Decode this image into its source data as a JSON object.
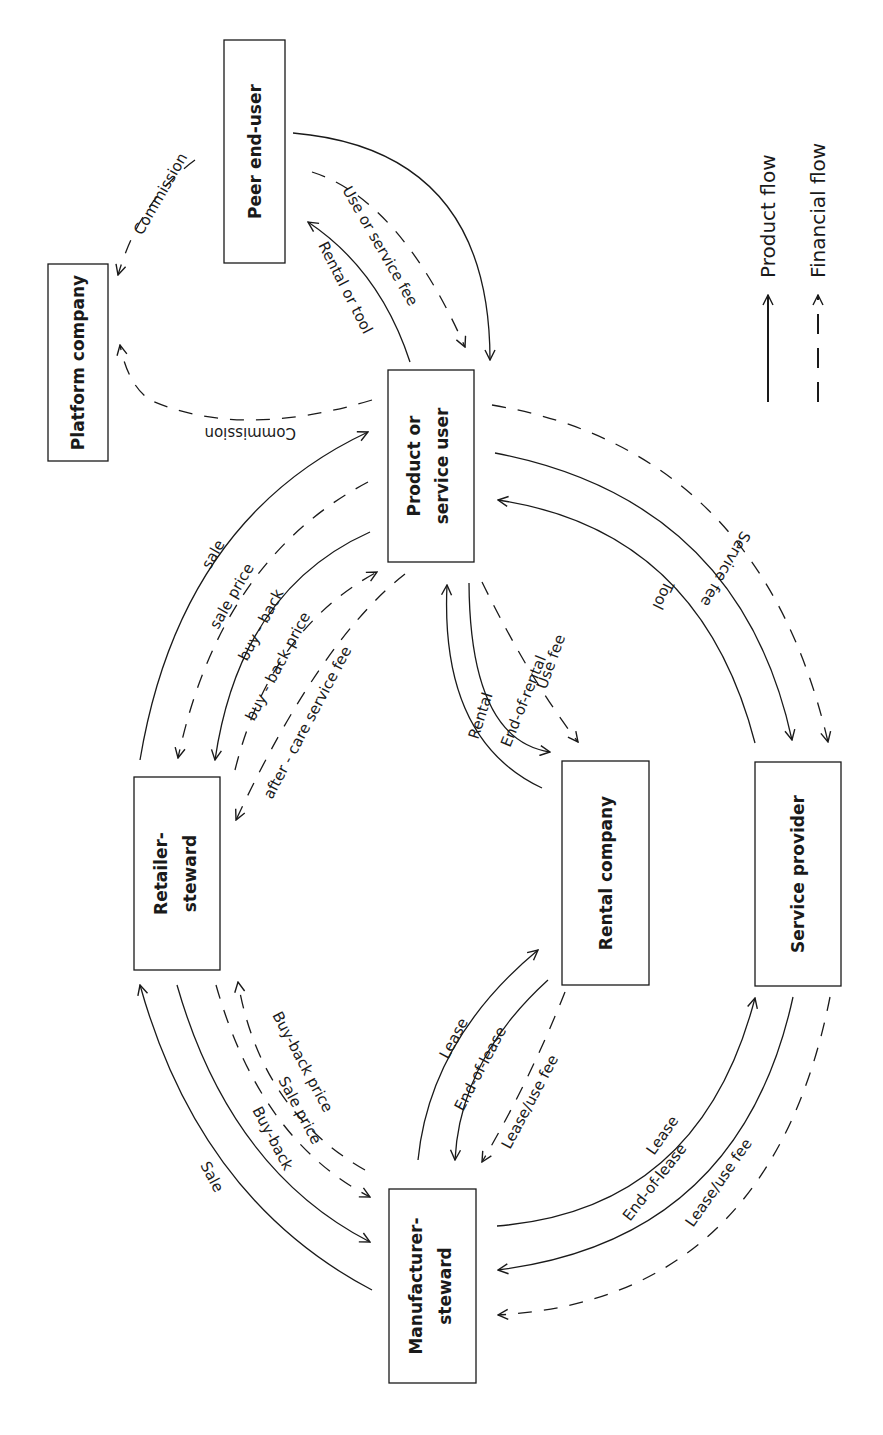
{
  "diagram": {
    "orientation": "rotated 90 degrees clockwise",
    "nodes": {
      "peer": {
        "label": "Peer end-user"
      },
      "platform": {
        "label": "Platform company"
      },
      "user": {
        "line1": "Product or",
        "line2": "service user"
      },
      "retailer": {
        "line1": "Retailer-",
        "line2": "steward"
      },
      "rental": {
        "label": "Rental company"
      },
      "service": {
        "label": "Service provider"
      },
      "manufacturer": {
        "line1": "Manufacturer-",
        "line2": "steward"
      }
    },
    "edges": {
      "peer_commission": "Commission",
      "user_commission": "Commission",
      "rental_or_tool": "Rental or tool",
      "use_or_service_fee": "Use or service fee",
      "sale": "sale",
      "sale_price": "sale price",
      "buy_back": "buy - back",
      "buy_back_price": "buy - back price",
      "after_care_fee": "after - care service fee",
      "rental": "Rental",
      "end_of_rental": "End-of-rental",
      "use_fee": "Use fee",
      "tool": "Tool",
      "service_fee": "Service fee",
      "mfr_sale": "Sale",
      "mfr_buy_back": "Buy-back",
      "mfr_sale_price": "Sale price",
      "mfr_buy_back_price": "Buy-back price",
      "rc_lease": "Lease",
      "rc_end_of_lease": "End-of-lease",
      "rc_lease_use_fee": "Lease/use fee",
      "sp_lease": "Lease",
      "sp_end_of_lease": "End-of-lease",
      "sp_lease_use_fee": "Lease/use fee"
    },
    "legend": {
      "product_flow": "Product flow",
      "financial_flow": "Financial flow"
    }
  }
}
